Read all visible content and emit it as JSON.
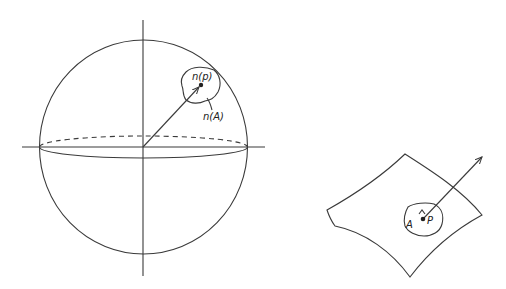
{
  "figure": {
    "sphere": {
      "label_point": "n(p)",
      "label_region": "n(A)",
      "center": [
        143,
        147
      ],
      "radius_x": 104,
      "radius_y": 107
    },
    "surface": {
      "label_region": "A",
      "label_point": "P"
    },
    "stroke_color": "#3a3a3a",
    "background_color": "#ffffff"
  }
}
